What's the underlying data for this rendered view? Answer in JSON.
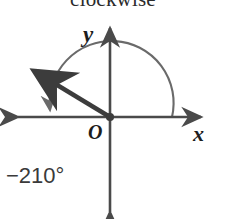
{
  "caption": {
    "text": "clockwise"
  },
  "diagram": {
    "type": "angle-in-standard-position",
    "origin_label": "O",
    "axes": {
      "x_label": "x",
      "y_label": "y"
    },
    "angle": {
      "label": "−210°",
      "degrees": -210,
      "direction": "clockwise",
      "initial_side_degrees": 0,
      "terminal_side_degrees": 150
    },
    "colors": {
      "axis": "#4a4a4a",
      "ray": "#3c3c3c",
      "arc": "#6a6a6a",
      "text": "#1d1d1d",
      "background": "#ffffff"
    }
  }
}
